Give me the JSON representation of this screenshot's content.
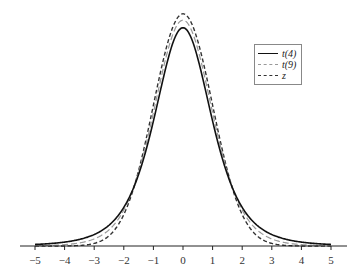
{
  "chart_data": {
    "type": "line",
    "title": "",
    "xlabel": "",
    "ylabel": "",
    "xlim": [
      -5,
      5
    ],
    "xticks": [
      -5,
      -4,
      -3,
      -2,
      -1,
      0,
      1,
      2,
      3,
      4,
      5
    ],
    "xtick_labels": [
      "−5",
      "−4",
      "−3",
      "−2",
      "−1",
      "0",
      "1",
      "2",
      "3",
      "4",
      "5"
    ],
    "grid": false,
    "legend_position": "upper right",
    "series": [
      {
        "name": "t(4)",
        "distribution": "student-t",
        "df": 4,
        "style": "solid",
        "color": "#111111",
        "peak": 0.375
      },
      {
        "name": "t(9)",
        "distribution": "student-t",
        "df": 9,
        "style": "long-dash",
        "color": "#999999",
        "peak": 0.388
      },
      {
        "name": "z",
        "distribution": "standard-normal",
        "style": "dash",
        "color": "#333333",
        "peak": 0.399
      }
    ]
  },
  "legend": {
    "items": [
      {
        "label": "t(4)"
      },
      {
        "label": "t(9)"
      },
      {
        "label": "z"
      }
    ]
  }
}
